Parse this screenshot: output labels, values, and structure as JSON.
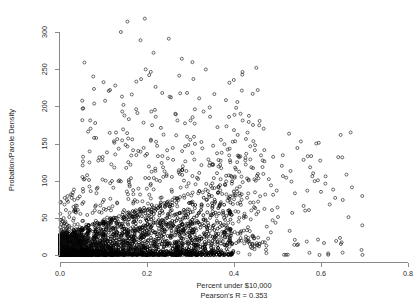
{
  "chart_data": {
    "type": "scatter",
    "title": "",
    "xlabel": "Percent under $10,000",
    "ylabel": "Probation/Parole Density",
    "subtitle": "Pearson's R = 0.353",
    "pearson_r": 0.353,
    "xlim": [
      0.0,
      0.8
    ],
    "ylim": [
      0,
      310
    ],
    "xticks": [
      0.0,
      0.2,
      0.4,
      0.6,
      0.8
    ],
    "xtick_labels": [
      "0.0",
      "0.2",
      "0.4",
      "0.6",
      "0.8"
    ],
    "yticks": [
      0,
      50,
      100,
      150,
      200,
      250,
      300
    ],
    "ytick_labels": [
      "0",
      "50",
      "100",
      "150",
      "200",
      "250",
      "300"
    ],
    "grid": false,
    "legend": null,
    "marker": "open-circle",
    "marker_color": "#000000",
    "marker_size": 3,
    "point_count_approx": 3100,
    "points": [
      [
        0.012,
        2
      ],
      [
        0.015,
        4
      ],
      [
        0.018,
        3
      ],
      [
        0.021,
        6
      ],
      [
        0.024,
        2
      ],
      [
        0.027,
        8
      ],
      [
        0.03,
        5
      ],
      [
        0.033,
        3
      ],
      [
        0.036,
        9
      ],
      [
        0.039,
        4
      ],
      [
        0.042,
        11
      ],
      [
        0.045,
        6
      ],
      [
        0.048,
        2
      ],
      [
        0.051,
        13
      ],
      [
        0.054,
        7
      ],
      [
        0.057,
        4
      ],
      [
        0.06,
        15
      ],
      [
        0.063,
        9
      ],
      [
        0.066,
        5
      ],
      [
        0.069,
        18
      ],
      [
        0.072,
        11
      ],
      [
        0.075,
        6
      ],
      [
        0.078,
        21
      ],
      [
        0.081,
        13
      ],
      [
        0.084,
        7
      ],
      [
        0.087,
        24
      ],
      [
        0.09,
        15
      ],
      [
        0.093,
        9
      ],
      [
        0.096,
        27
      ],
      [
        0.099,
        17
      ],
      [
        0.102,
        10
      ],
      [
        0.105,
        30
      ],
      [
        0.108,
        19
      ],
      [
        0.111,
        12
      ],
      [
        0.114,
        33
      ],
      [
        0.117,
        21
      ],
      [
        0.12,
        14
      ],
      [
        0.123,
        36
      ],
      [
        0.126,
        23
      ],
      [
        0.129,
        15
      ],
      [
        0.132,
        39
      ],
      [
        0.135,
        25
      ],
      [
        0.138,
        17
      ],
      [
        0.141,
        42
      ],
      [
        0.144,
        27
      ],
      [
        0.147,
        18
      ],
      [
        0.15,
        45
      ],
      [
        0.153,
        29
      ],
      [
        0.156,
        20
      ],
      [
        0.159,
        48
      ],
      [
        0.162,
        31
      ],
      [
        0.165,
        21
      ],
      [
        0.168,
        51
      ],
      [
        0.171,
        33
      ],
      [
        0.174,
        23
      ],
      [
        0.177,
        54
      ],
      [
        0.18,
        35
      ],
      [
        0.183,
        24
      ],
      [
        0.186,
        57
      ],
      [
        0.189,
        37
      ],
      [
        0.192,
        26
      ],
      [
        0.195,
        60
      ],
      [
        0.198,
        39
      ],
      [
        0.201,
        27
      ],
      [
        0.204,
        62
      ],
      [
        0.207,
        41
      ],
      [
        0.21,
        29
      ],
      [
        0.213,
        64
      ],
      [
        0.216,
        43
      ],
      [
        0.219,
        30
      ],
      [
        0.222,
        66
      ],
      [
        0.225,
        45
      ],
      [
        0.228,
        32
      ],
      [
        0.231,
        68
      ],
      [
        0.234,
        47
      ],
      [
        0.237,
        33
      ],
      [
        0.24,
        70
      ],
      [
        0.243,
        49
      ],
      [
        0.246,
        35
      ],
      [
        0.249,
        72
      ],
      [
        0.252,
        51
      ],
      [
        0.255,
        36
      ],
      [
        0.258,
        74
      ],
      [
        0.261,
        53
      ],
      [
        0.264,
        38
      ],
      [
        0.267,
        76
      ],
      [
        0.27,
        55
      ],
      [
        0.273,
        39
      ],
      [
        0.276,
        78
      ],
      [
        0.279,
        57
      ],
      [
        0.282,
        41
      ],
      [
        0.285,
        80
      ],
      [
        0.288,
        59
      ],
      [
        0.291,
        42
      ],
      [
        0.294,
        82
      ],
      [
        0.297,
        61
      ],
      [
        0.3,
        44
      ],
      [
        0.305,
        84
      ],
      [
        0.31,
        63
      ],
      [
        0.315,
        46
      ],
      [
        0.32,
        86
      ],
      [
        0.325,
        65
      ],
      [
        0.33,
        48
      ],
      [
        0.335,
        88
      ],
      [
        0.34,
        67
      ],
      [
        0.345,
        50
      ],
      [
        0.35,
        90
      ],
      [
        0.355,
        69
      ],
      [
        0.36,
        52
      ],
      [
        0.365,
        92
      ],
      [
        0.37,
        71
      ],
      [
        0.375,
        54
      ],
      [
        0.38,
        94
      ],
      [
        0.385,
        73
      ],
      [
        0.39,
        56
      ],
      [
        0.395,
        96
      ],
      [
        0.4,
        75
      ],
      [
        0.41,
        58
      ],
      [
        0.42,
        98
      ],
      [
        0.43,
        77
      ],
      [
        0.44,
        60
      ],
      [
        0.45,
        100
      ],
      [
        0.46,
        79
      ],
      [
        0.47,
        62
      ],
      [
        0.48,
        102
      ],
      [
        0.49,
        81
      ],
      [
        0.5,
        64
      ],
      [
        0.52,
        104
      ],
      [
        0.54,
        83
      ],
      [
        0.56,
        66
      ],
      [
        0.58,
        106
      ],
      [
        0.6,
        85
      ],
      [
        0.62,
        68
      ],
      [
        0.14,
        300
      ],
      [
        0.155,
        314
      ],
      [
        0.195,
        318
      ],
      [
        0.185,
        289
      ],
      [
        0.215,
        272
      ],
      [
        0.25,
        291
      ],
      [
        0.28,
        264
      ],
      [
        0.205,
        242
      ],
      [
        0.115,
        222
      ],
      [
        0.165,
        216
      ],
      [
        0.235,
        218
      ],
      [
        0.252,
        213
      ],
      [
        0.31,
        196
      ],
      [
        0.33,
        193
      ],
      [
        0.345,
        186
      ],
      [
        0.3,
        181
      ],
      [
        0.405,
        198
      ],
      [
        0.415,
        190
      ],
      [
        0.42,
        181
      ],
      [
        0.4,
        168
      ],
      [
        0.145,
        169
      ],
      [
        0.175,
        196
      ],
      [
        0.178,
        191
      ],
      [
        0.21,
        193
      ],
      [
        0.22,
        186
      ],
      [
        0.232,
        171
      ],
      [
        0.238,
        162
      ],
      [
        0.192,
        178
      ],
      [
        0.265,
        190
      ],
      [
        0.27,
        181
      ],
      [
        0.362,
        172
      ],
      [
        0.308,
        159
      ],
      [
        0.295,
        148
      ],
      [
        0.325,
        152
      ],
      [
        0.352,
        147
      ],
      [
        0.37,
        155
      ],
      [
        0.378,
        149
      ],
      [
        0.39,
        143
      ],
      [
        0.155,
        146
      ],
      [
        0.168,
        141
      ],
      [
        0.185,
        139
      ],
      [
        0.2,
        136
      ],
      [
        0.225,
        133
      ],
      [
        0.248,
        130
      ],
      [
        0.26,
        128
      ],
      [
        0.288,
        126
      ],
      [
        0.125,
        151
      ],
      [
        0.135,
        143
      ],
      [
        0.108,
        138
      ],
      [
        0.098,
        132
      ],
      [
        0.088,
        127
      ],
      [
        0.118,
        122
      ],
      [
        0.448,
        141
      ],
      [
        0.462,
        134
      ],
      [
        0.47,
        126
      ],
      [
        0.49,
        132
      ],
      [
        0.51,
        120
      ],
      [
        0.53,
        113
      ],
      [
        0.582,
        110
      ],
      [
        0.61,
        96
      ],
      [
        0.628,
        88
      ],
      [
        0.65,
        74
      ],
      [
        0.56,
        128
      ],
      [
        0.575,
        118
      ],
      [
        0.44,
        118
      ],
      [
        0.455,
        109
      ],
      [
        0.43,
        103
      ],
      [
        0.412,
        112
      ],
      [
        0.395,
        105
      ],
      [
        0.382,
        99
      ],
      [
        0.368,
        94
      ],
      [
        0.355,
        90
      ],
      [
        0.34,
        86
      ],
      [
        0.318,
        83
      ],
      [
        0.302,
        80
      ],
      [
        0.286,
        77
      ],
      [
        0.272,
        74
      ],
      [
        0.258,
        71
      ],
      [
        0.244,
        69
      ],
      [
        0.23,
        66
      ],
      [
        0.216,
        63
      ],
      [
        0.202,
        61
      ],
      [
        0.188,
        58
      ],
      [
        0.174,
        56
      ],
      [
        0.16,
        53
      ],
      [
        0.146,
        51
      ],
      [
        0.132,
        49
      ]
    ]
  },
  "axes": {
    "y_axis_title": "Probation/Parole Density",
    "x_axis_title": "Percent under $10,000",
    "subtitle": "Pearson's R = 0.353"
  }
}
